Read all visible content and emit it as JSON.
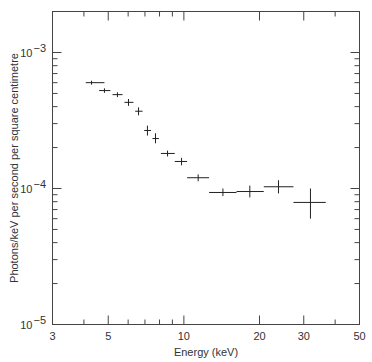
{
  "chart_data": {
    "type": "scatter",
    "title": "",
    "xlabel": "Energy (keV)",
    "ylabel": "Photons/keV per second per square centimetre",
    "xscale": "log",
    "yscale": "log",
    "xlim": [
      3,
      50
    ],
    "ylim": [
      1e-05,
      0.00204
    ],
    "grid": false,
    "legend": null,
    "x_ticks": [
      {
        "value": 3,
        "label": "3"
      },
      {
        "value": 5,
        "label": "5"
      },
      {
        "value": 10,
        "label": "10"
      },
      {
        "value": 20,
        "label": "20"
      },
      {
        "value": 30,
        "label": "30"
      },
      {
        "value": 50,
        "label": "50"
      }
    ],
    "x_minor_ticks": [
      4,
      6,
      7,
      8,
      9,
      40
    ],
    "y_ticks": [
      {
        "value": 1e-05,
        "label": "10",
        "exp": "−5"
      },
      {
        "value": 0.0001,
        "label": "10",
        "exp": "−4"
      },
      {
        "value": 0.001,
        "label": "10",
        "exp": "−3"
      }
    ],
    "series": [
      {
        "name": "X-ray spectrum",
        "points": [
          {
            "x": 4.29,
            "y": 0.0006,
            "xlo": 4.07,
            "xhi": 4.83,
            "ylo": 0.00058,
            "yhi": 0.00062
          },
          {
            "x": 4.83,
            "y": 0.000525,
            "xlo": 4.6,
            "xhi": 5.1,
            "ylo": 0.000505,
            "yhi": 0.000545
          },
          {
            "x": 5.44,
            "y": 0.00049,
            "xlo": 5.2,
            "xhi": 5.7,
            "ylo": 0.00047,
            "yhi": 0.00051
          },
          {
            "x": 6.02,
            "y": 0.00043,
            "xlo": 5.8,
            "xhi": 6.3,
            "ylo": 0.000405,
            "yhi": 0.000455
          },
          {
            "x": 6.6,
            "y": 0.00037,
            "xlo": 6.4,
            "xhi": 6.85,
            "ylo": 0.000345,
            "yhi": 0.000395
          },
          {
            "x": 7.16,
            "y": 0.000267,
            "xlo": 6.95,
            "xhi": 7.4,
            "ylo": 0.000245,
            "yhi": 0.00029
          },
          {
            "x": 7.71,
            "y": 0.000233,
            "xlo": 7.5,
            "xhi": 7.95,
            "ylo": 0.000215,
            "yhi": 0.000255
          },
          {
            "x": 8.61,
            "y": 0.000181,
            "xlo": 8.1,
            "xhi": 9.2,
            "ylo": 0.000172,
            "yhi": 0.00019
          },
          {
            "x": 9.79,
            "y": 0.000158,
            "xlo": 9.2,
            "xhi": 10.3,
            "ylo": 0.000148,
            "yhi": 0.000168
          },
          {
            "x": 11.4,
            "y": 0.00012,
            "xlo": 10.3,
            "xhi": 12.6,
            "ylo": 0.000113,
            "yhi": 0.000127
          },
          {
            "x": 14.3,
            "y": 9.35e-05,
            "xlo": 12.6,
            "xhi": 16.2,
            "ylo": 8.8e-05,
            "yhi": 0.0001
          },
          {
            "x": 18.3,
            "y": 9.5e-05,
            "xlo": 16.2,
            "xhi": 20.8,
            "ylo": 8.6e-05,
            "yhi": 0.000105
          },
          {
            "x": 23.8,
            "y": 0.000103,
            "xlo": 20.8,
            "xhi": 27.3,
            "ylo": 9.2e-05,
            "yhi": 0.000115
          },
          {
            "x": 31.9,
            "y": 7.9e-05,
            "xlo": 27.3,
            "xhi": 36.7,
            "ylo": 6e-05,
            "yhi": 0.0001
          }
        ]
      }
    ]
  },
  "labels": {
    "xlabel": "Energy (keV)",
    "ylabel": "Photons/keV per second per square centimetre"
  }
}
